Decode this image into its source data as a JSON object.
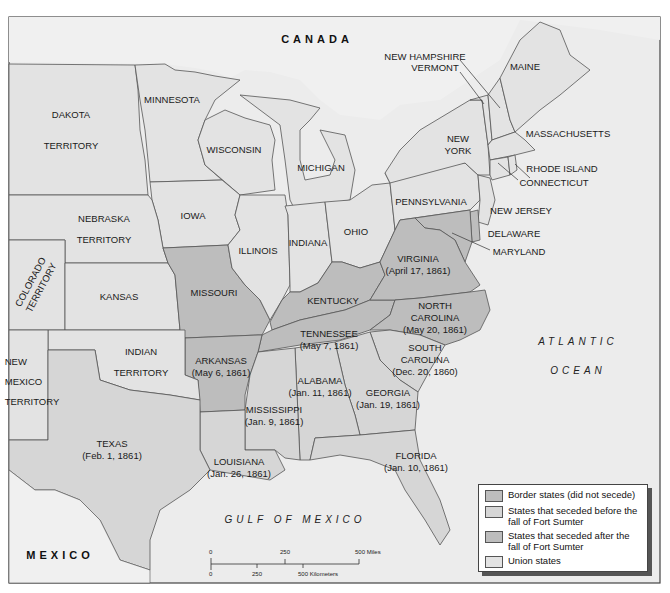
{
  "map": {
    "colors": {
      "border": "#a9a9a9",
      "seceded_before": "#d6d6d6",
      "seceded_after": "#bdbdbd",
      "union": "#e3e3e3",
      "foreign": "#f0f0f0",
      "water": "#ececec",
      "line": "#555555"
    },
    "countries": {
      "canada": "CANADA",
      "mexico": "MEXICO"
    },
    "water_bodies": {
      "atlantic_1": "ATLANTIC",
      "atlantic_2": "OCEAN",
      "gulf": "GULF OF MEXICO"
    },
    "regions": {
      "dakota_1": "DAKOTA",
      "dakota_2": "TERRITORY",
      "minnesota": "MINNESOTA",
      "wisconsin": "WISCONSIN",
      "michigan": "MICHIGAN",
      "iowa": "IOWA",
      "nebraska_1": "NEBRASKA",
      "nebraska_2": "TERRITORY",
      "colorado_1": "COLORADO",
      "colorado_2": "TERRITORY",
      "kansas": "KANSAS",
      "missouri": "MISSOURI",
      "illinois": "ILLINOIS",
      "indiana": "INDIANA",
      "ohio": "OHIO",
      "kentucky": "KENTUCKY",
      "pennsylvania": "PENNSYLVANIA",
      "new_york_1": "NEW",
      "new_york_2": "YORK",
      "maine": "MAINE",
      "new_hampshire": "NEW HAMPSHIRE",
      "vermont": "VERMONT",
      "massachusetts": "MASSACHUSETTS",
      "rhode_island": "RHODE ISLAND",
      "connecticut": "CONNECTICUT",
      "new_jersey": "NEW JERSEY",
      "delaware": "DELAWARE",
      "maryland": "MARYLAND",
      "virginia_1": "VIRGINIA",
      "virginia_2": "(April 17, 1861)",
      "north_carolina_1": "NORTH",
      "north_carolina_2": "CAROLINA",
      "north_carolina_3": "(May 20, 1861)",
      "tennessee_1": "TENNESSEE",
      "tennessee_2": "(May 7, 1861)",
      "arkansas_1": "ARKANSAS",
      "arkansas_2": "(May 6, 1861)",
      "south_carolina_1": "SOUTH",
      "south_carolina_2": "CAROLINA",
      "south_carolina_3": "(Dec. 20, 1860)",
      "georgia_1": "GEORGIA",
      "georgia_2": "(Jan. 19, 1861)",
      "alabama_1": "ALABAMA",
      "alabama_2": "(Jan. 11, 1861)",
      "mississippi_1": "MISSISSIPPI",
      "mississippi_2": "(Jan. 9, 1861)",
      "louisiana_1": "LOUISIANA",
      "louisiana_2": "(Jan. 26, 1861)",
      "florida_1": "FLORIDA",
      "florida_2": "(Jan. 10, 1861)",
      "texas_1": "TEXAS",
      "texas_2": "(Feb. 1, 1861)",
      "indian_1": "INDIAN",
      "indian_2": "TERRITORY",
      "new_mexico_1": "NEW",
      "new_mexico_2": "MEXICO",
      "new_mexico_3": "TERRITORY"
    },
    "legend": [
      {
        "label": "Border states (did not secede)",
        "color": "#bdbdbd"
      },
      {
        "label": "States that seceded before the fall of Fort Sumter",
        "color": "#d6d6d6"
      },
      {
        "label": "States that seceded after the fall of Fort Sumter",
        "color": "#bdbdbd"
      },
      {
        "label": "Union states",
        "color": "#e3e3e3"
      }
    ],
    "scale": {
      "miles_0": "0",
      "miles_250": "250",
      "miles_500": "500 Miles",
      "km_0": "0",
      "km_250": "250",
      "km_500": "500 Kilometers"
    }
  }
}
